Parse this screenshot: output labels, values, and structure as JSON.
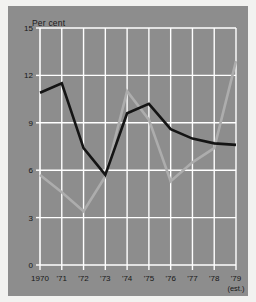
{
  "chart_data": {
    "type": "line",
    "title": "",
    "ylabel": "Per cent",
    "xlabel": "",
    "ylim": [
      0,
      15
    ],
    "yticks": [
      0,
      3,
      6,
      9,
      12,
      15
    ],
    "grid": true,
    "legend": "none",
    "categories": [
      "1970",
      "'71",
      "'72",
      "'73",
      "'74",
      "'75",
      "'76",
      "'77",
      "'78",
      "'79"
    ],
    "x_sublabel": "(est.)",
    "x_sublabel_index": 9,
    "series": [
      {
        "name": "black-series",
        "color": "#141414",
        "values": [
          10.9,
          11.5,
          7.4,
          5.7,
          9.6,
          10.2,
          8.6,
          8.0,
          7.7,
          7.6
        ]
      },
      {
        "name": "gray-series",
        "color": "#adadad",
        "values": [
          5.7,
          4.6,
          3.4,
          5.6,
          11.0,
          9.2,
          5.3,
          6.5,
          7.4,
          12.9
        ]
      }
    ]
  },
  "colors": {
    "panel_background": "#8d8d8d",
    "page_background": "#f2f2f0",
    "gridline": "#ffffff",
    "axis_text": "#171717",
    "series_black": "#141414",
    "series_gray": "#adadad"
  }
}
